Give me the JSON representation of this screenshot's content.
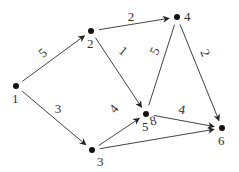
{
  "diagram": {
    "type": "weighted-directed-graph",
    "colors": {
      "stroke": "#444444",
      "node": "#111111",
      "text": "#333333",
      "background": "#ffffff"
    },
    "nodes": [
      {
        "id": "1",
        "label": "1",
        "x": 16,
        "y": 86,
        "lx": 12,
        "ly": 103
      },
      {
        "id": "2",
        "label": "2",
        "x": 91,
        "y": 31,
        "lx": 87,
        "ly": 48
      },
      {
        "id": "3",
        "label": "3",
        "x": 92,
        "y": 150,
        "lx": 97,
        "ly": 166
      },
      {
        "id": "4",
        "label": "4",
        "x": 177,
        "y": 17,
        "lx": 184,
        "ly": 21
      },
      {
        "id": "5",
        "label": "5",
        "x": 146,
        "y": 114,
        "lx": 142,
        "ly": 131
      },
      {
        "id": "6",
        "label": "6",
        "x": 222,
        "y": 128,
        "lx": 218,
        "ly": 145
      }
    ],
    "edges": [
      {
        "from": "1",
        "to": "2",
        "weight": "5",
        "directed": true,
        "wx": 43,
        "wy": 57,
        "rot": -40
      },
      {
        "from": "1",
        "to": "3",
        "weight": "3",
        "directed": true,
        "wx": 58,
        "wy": 113,
        "rot": 0
      },
      {
        "from": "2",
        "to": "4",
        "weight": "2",
        "directed": true,
        "wx": 131,
        "wy": 21,
        "rot": 0
      },
      {
        "from": "2",
        "to": "5",
        "weight": "1",
        "directed": true,
        "wx": 123,
        "wy": 55,
        "rot": 40
      },
      {
        "from": "3",
        "to": "5",
        "weight": "4",
        "directed": true,
        "wx": 114,
        "wy": 113,
        "rot": -50
      },
      {
        "from": "3",
        "to": "6",
        "weight": "8",
        "directed": true,
        "wx": 153,
        "wy": 125,
        "rot": -15
      },
      {
        "from": "4",
        "to": "5",
        "weight": "5",
        "directed": false,
        "wx": 155,
        "wy": 55,
        "rot": -65
      },
      {
        "from": "4",
        "to": "6",
        "weight": "2",
        "directed": true,
        "wx": 205,
        "wy": 57,
        "rot": 65
      },
      {
        "from": "5",
        "to": "6",
        "weight": "4",
        "directed": true,
        "wx": 182,
        "wy": 114,
        "rot": 10
      }
    ]
  }
}
